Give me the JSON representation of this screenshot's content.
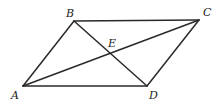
{
  "figure": {
    "type": "parallelogram-with-diagonals",
    "points": {
      "A": {
        "label": "A",
        "x": 23,
        "y": 86,
        "lx": 11,
        "ly": 99
      },
      "B": {
        "label": "B",
        "x": 74,
        "y": 21,
        "lx": 66,
        "ly": 17
      },
      "C": {
        "label": "C",
        "x": 199,
        "y": 20,
        "lx": 203,
        "ly": 16
      },
      "D": {
        "label": "D",
        "x": 147,
        "y": 86,
        "lx": 149,
        "ly": 99
      },
      "E": {
        "label": "E",
        "x": 110,
        "y": 54,
        "lx": 108,
        "ly": 47
      }
    },
    "segments": [
      {
        "name": "side-ab",
        "from": "A",
        "to": "B"
      },
      {
        "name": "side-bc",
        "from": "B",
        "to": "C"
      },
      {
        "name": "side-cd",
        "from": "C",
        "to": "D"
      },
      {
        "name": "side-da",
        "from": "D",
        "to": "A"
      },
      {
        "name": "diagonal-ac",
        "from": "A",
        "to": "C"
      },
      {
        "name": "diagonal-bd",
        "from": "B",
        "to": "D"
      }
    ],
    "colors": {
      "stroke": "#2a2a2a",
      "label": "#222222",
      "background": "#ffffff"
    }
  }
}
